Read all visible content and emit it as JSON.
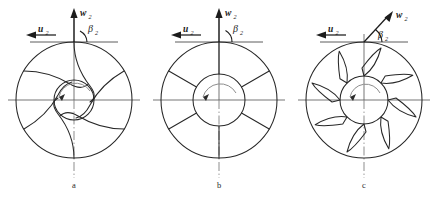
{
  "figure": {
    "background_color": "#ffffff",
    "line_color": "#272727",
    "axis_color": "#5d5d5d",
    "width": 438,
    "height": 200
  },
  "labels": {
    "w_symbol": "w",
    "w_subscript": "2",
    "u_symbol": "u",
    "u_subscript": "2",
    "beta_symbol": "β",
    "beta_subscript": "2"
  },
  "panels": [
    {
      "id": "a",
      "caption": "a",
      "blade_type": "backward-curved",
      "blade_count": 6,
      "center_x": 74,
      "center_y": 100,
      "outer_radius": 58,
      "hub_radius": 20,
      "w2_angle_deg": 90,
      "beta2_deg": 55,
      "w2_label": "w",
      "u2_label": "u",
      "beta2_label": "β"
    },
    {
      "id": "b",
      "caption": "b",
      "blade_type": "radial straight",
      "blade_count": 6,
      "center_x": 219,
      "center_y": 100,
      "outer_radius": 58,
      "hub_radius": 26,
      "w2_angle_deg": 90,
      "beta2_deg": 90,
      "w2_label": "w",
      "u2_label": "u",
      "beta2_label": "β"
    },
    {
      "id": "c",
      "caption": "c",
      "blade_type": "forward-curved",
      "blade_count": 8,
      "center_x": 364,
      "center_y": 100,
      "outer_radius": 58,
      "hub_radius": 24,
      "w2_angle_deg": 62,
      "beta2_deg": 118,
      "w2_label": "w",
      "u2_label": "u",
      "beta2_label": "β"
    }
  ],
  "captions": {
    "a": "a",
    "b": "b",
    "c": "c"
  },
  "rotation": {
    "direction": "counter-clockwise",
    "marker": "arc-arrow"
  }
}
